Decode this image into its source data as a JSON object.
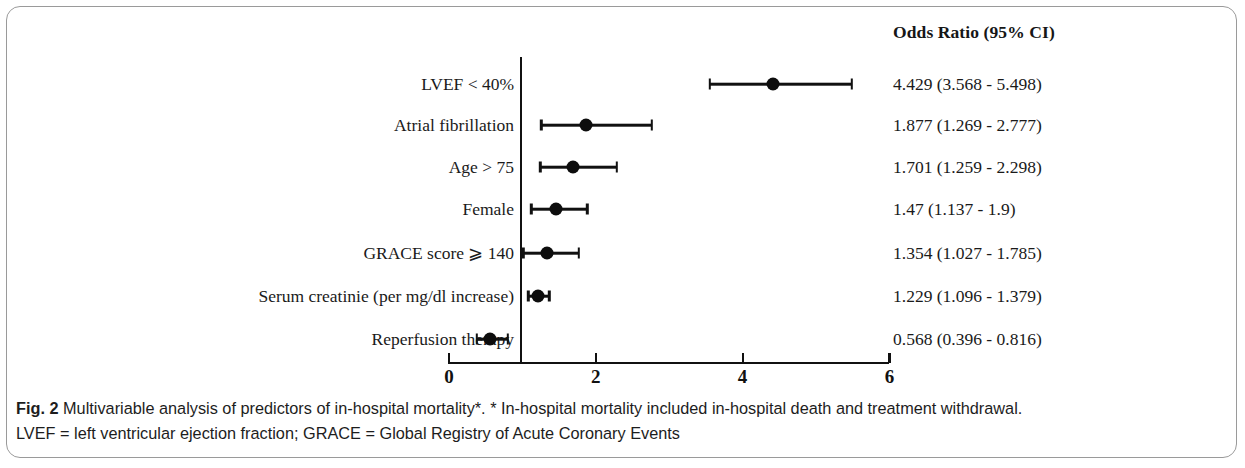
{
  "figure": {
    "number_label": "Fig. 2",
    "caption_line1": "Multivariable analysis of predictors of in-hospital mortality*. * In-hospital mortality included in-hospital death and treatment withdrawal.",
    "caption_line2": "LVEF = left ventricular ejection fraction; GRACE = Global Registry of Acute Coronary Events"
  },
  "column_header": "Odds Ratio (95% CI)",
  "chart_data": {
    "type": "scatter",
    "subtype": "forest-plot",
    "title": "Multivariable analysis of predictors of in-hospital mortality",
    "xlabel": "",
    "ylabel": "",
    "xlim": [
      0,
      6
    ],
    "xticks": [
      0,
      2,
      4,
      6
    ],
    "xtick_labels": [
      "0",
      "2",
      "4",
      "6"
    ],
    "reference_line": 1,
    "grid": false,
    "legend": "none",
    "effect_measure": "Odds Ratio (95% CI)",
    "categories": [
      "LVEF < 40%",
      "Atrial fibrillation",
      "Age > 75",
      "Female",
      "GRACE score ⩾ 140",
      "Serum creatinie (per mg/dl increase)",
      "Reperfusion therapy"
    ],
    "values": [
      4.429,
      1.877,
      1.701,
      1.47,
      1.354,
      1.229,
      0.568
    ],
    "ci_low": [
      3.568,
      1.269,
      1.259,
      1.137,
      1.027,
      1.096,
      0.396
    ],
    "ci_high": [
      5.498,
      2.777,
      2.298,
      1.9,
      1.785,
      1.379,
      0.816
    ],
    "value_labels": [
      "4.429 (3.568 - 5.498)",
      "1.877 (1.269 - 2.777)",
      "1.701 (1.259 - 2.298)",
      "1.47 (1.137 - 1.9)",
      "1.354 (1.027 - 1.785)",
      "1.229 (1.096 - 1.379)",
      "0.568 (0.396 - 0.816)"
    ],
    "marker_color": "#0d0d0d",
    "line_color": "#111111"
  },
  "rows": [
    {
      "label": "LVEF < 40%",
      "or": "4.429 (3.568 - 5.498)",
      "y": 84,
      "est": 4.429,
      "lo": 3.568,
      "hi": 5.498
    },
    {
      "label": "Atrial fibrillation",
      "or": "1.877 (1.269 - 2.777)",
      "y": 125,
      "est": 1.877,
      "lo": 1.269,
      "hi": 2.777
    },
    {
      "label": "Age > 75",
      "or": "1.701 (1.259 - 2.298)",
      "y": 167,
      "est": 1.701,
      "lo": 1.259,
      "hi": 2.298
    },
    {
      "label": "Female",
      "or": "1.47 (1.137 - 1.9)",
      "y": 209,
      "est": 1.47,
      "lo": 1.137,
      "hi": 1.9
    },
    {
      "label": "GRACE score ⩾ 140",
      "or": "1.354 (1.027 - 1.785)",
      "y": 253,
      "est": 1.354,
      "lo": 1.027,
      "hi": 1.785
    },
    {
      "label": "Serum creatinie (per mg/dl increase)",
      "or": "1.229 (1.096 - 1.379)",
      "y": 296,
      "est": 1.229,
      "lo": 1.096,
      "hi": 1.379
    },
    {
      "label": "Reperfusion therapy",
      "or": "0.568 (0.396 - 0.816)",
      "y": 339,
      "est": 0.568,
      "lo": 0.396,
      "hi": 0.816
    }
  ],
  "axis": {
    "x0_px": 448,
    "x_per_unit_px": 73.4,
    "ticks": [
      {
        "value": 0,
        "label": "0"
      },
      {
        "value": 2,
        "label": "2"
      },
      {
        "value": 4,
        "label": "4"
      },
      {
        "value": 6,
        "label": "6"
      }
    ]
  }
}
